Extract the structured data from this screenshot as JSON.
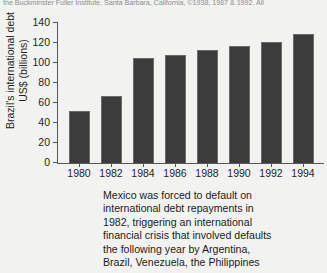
{
  "topline": "the Buckminster Fuller Institute, Santa Barbara, California, ©1938, 1967 & 1992. All",
  "chart_data": {
    "type": "bar",
    "title": "",
    "xlabel": "",
    "ylabel": "Brazil's international debt US$ (billions)",
    "categories": [
      "1980",
      "1982",
      "1984",
      "1986",
      "1988",
      "1990",
      "1992",
      "1994"
    ],
    "values": [
      52,
      67,
      105,
      108,
      113,
      117,
      121,
      129
    ],
    "ylim": [
      0,
      140
    ],
    "yticks": [
      0,
      20,
      40,
      60,
      80,
      100,
      120,
      140
    ],
    "ytick_labels": [
      "0",
      "20",
      "40",
      "60",
      "80",
      "100",
      "120",
      "140"
    ],
    "grid": false,
    "legend": "none",
    "bar_color": "#3c3c3c",
    "axis_color": "#55585a"
  },
  "caption": {
    "lines": [
      "Mexico was forced to default on",
      "international debt repayments in",
      "1982, triggering an international",
      "financial crisis that involved defaults",
      "the following year by Argentina,",
      "Brazil, Venezuela, the Philippines"
    ]
  }
}
